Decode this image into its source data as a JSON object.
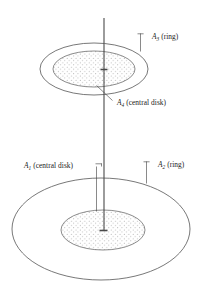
{
  "figure": {
    "type": "line-diagram",
    "background_color": "#ffffff",
    "line_color": "#555555",
    "text_color": "#1a1a1a",
    "labels": [
      {
        "id": "label-a3",
        "symbol": "A",
        "subscript": "3",
        "qualifier": "(ring)",
        "full_text": "A3 (ring)",
        "target": "upper-outer-ring",
        "position": "upper-right"
      },
      {
        "id": "label-a4",
        "symbol": "A",
        "subscript": "4",
        "qualifier": "(central disk)",
        "full_text": "A4 (central disk)",
        "target": "upper-central-disk",
        "position": "below-upper-figure"
      },
      {
        "id": "label-a1",
        "symbol": "A",
        "subscript": "1",
        "qualifier": "(central disk)",
        "full_text": "A1 (central disk)",
        "target": "lower-central-disk",
        "position": "middle-left"
      },
      {
        "id": "label-a2",
        "symbol": "A",
        "subscript": "2",
        "qualifier": "(ring)",
        "full_text": "A2 (ring)",
        "target": "lower-outer-ring",
        "position": "middle-right"
      }
    ],
    "shapes": {
      "upper_outer_ellipse": {
        "cx": 94,
        "cy": 69,
        "rx": 54,
        "ry": 26
      },
      "upper_inner_ellipse": {
        "cx": 94,
        "cy": 69,
        "rx": 41,
        "ry": 18
      },
      "lower_outer_ellipse": {
        "cx": 101,
        "cy": 229,
        "rx": 89,
        "ry": 51
      },
      "lower_inner_ellipse": {
        "cx": 103,
        "cy": 230,
        "rx": 42,
        "ry": 20
      },
      "axis": {
        "x": 104,
        "y_top": 18,
        "y_bottom": 231
      }
    },
    "fill_pattern": "stipple-dots"
  }
}
